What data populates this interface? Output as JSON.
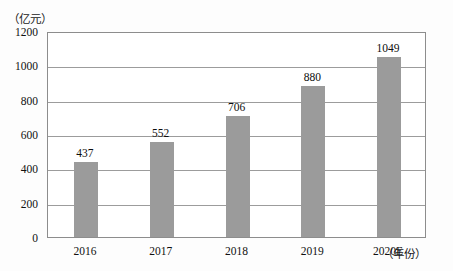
{
  "chart_data": {
    "type": "bar",
    "title": "",
    "subtitle": "",
    "xlabel": "（年份）",
    "ylabel": "（亿元）",
    "categories": [
      "2016",
      "2017",
      "2018",
      "2019",
      "2020E"
    ],
    "values": [
      437,
      552,
      706,
      880,
      1049
    ],
    "value_labels": [
      "437",
      "552",
      "706",
      "880",
      "1049"
    ],
    "series": [
      {
        "name": "",
        "values": [
          437,
          552,
          706,
          880,
          1049
        ]
      }
    ],
    "ylim": [
      0,
      1200
    ],
    "xlim": null,
    "ytick_labels": [
      "0",
      "200",
      "400",
      "600",
      "800",
      "1000",
      "1200"
    ],
    "ytick_values": [
      0,
      200,
      400,
      600,
      800,
      1000,
      1200
    ],
    "grid": true,
    "grid_axis": "y",
    "legend": false,
    "legend_position": "none",
    "annotations": [],
    "colors": {
      "bar_fill": "#9b9b9b",
      "grid_line": "#9c9c9c",
      "frame": "#8d8d8d",
      "text": "#111111",
      "plot_background": "#ffffff",
      "canvas_background": "#fdfdfd"
    }
  }
}
